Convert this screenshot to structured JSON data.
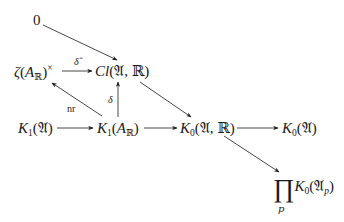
{
  "diagram": {
    "type": "commutative-diagram",
    "nodes": {
      "zero": "0",
      "zeta": {
        "func": "ζ",
        "open": "(",
        "arg": "A",
        "arg_sub": "ℝ",
        "close": ")",
        "sup": "×"
      },
      "cl": {
        "name": "Cl",
        "args": "(𝔄, ℝ)"
      },
      "k1a": {
        "name": "K",
        "sub": "1",
        "args": "(𝔄)"
      },
      "k1ar": {
        "name": "K",
        "sub": "1",
        "open": "(",
        "arg": "A",
        "arg_sub": "ℝ",
        "close": ")"
      },
      "k0ar": {
        "name": "K",
        "sub": "0",
        "args": "(𝔄, ℝ)"
      },
      "k0a": {
        "name": "K",
        "sub": "0",
        "args": "(𝔄)"
      },
      "prod": {
        "symbol": "∏",
        "index": "p",
        "name": "K",
        "sub": "0",
        "open": "(𝔄",
        "arg_sub": "p",
        "close": ")"
      }
    },
    "edge_labels": {
      "delta_hat": "δ̂",
      "delta": "δ",
      "nr": "nr"
    },
    "edges": [
      {
        "from": "0",
        "to": "Cl(𝔄,ℝ)",
        "label": ""
      },
      {
        "from": "ζ(A_ℝ)^×",
        "to": "Cl(𝔄,ℝ)",
        "label": "δ̂"
      },
      {
        "from": "K_1(A_ℝ)",
        "to": "ζ(A_ℝ)^×",
        "label": "nr"
      },
      {
        "from": "K_1(A_ℝ)",
        "to": "Cl(𝔄,ℝ)",
        "label": "δ"
      },
      {
        "from": "Cl(𝔄,ℝ)",
        "to": "K_0(𝔄,ℝ)",
        "label": ""
      },
      {
        "from": "K_1(𝔄)",
        "to": "K_1(A_ℝ)",
        "label": ""
      },
      {
        "from": "K_1(A_ℝ)",
        "to": "K_0(𝔄,ℝ)",
        "label": ""
      },
      {
        "from": "K_0(𝔄,ℝ)",
        "to": "K_0(𝔄)",
        "label": ""
      },
      {
        "from": "K_0(𝔄,ℝ)",
        "to": "∏_p K_0(𝔄_p)",
        "label": ""
      }
    ],
    "colors": {
      "ink": "#1a1a1a",
      "background": "#ffffff"
    }
  }
}
